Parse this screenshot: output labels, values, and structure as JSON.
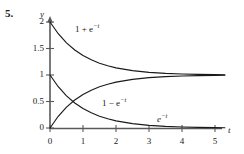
{
  "figure": {
    "problem_number": "5.",
    "axes": {
      "y_axis_name": "y",
      "x_axis_name": "t",
      "y_ticks": [
        {
          "value": 2,
          "label": "2"
        },
        {
          "value": 1.5,
          "label": "1.5"
        },
        {
          "value": 1,
          "label": "1"
        },
        {
          "value": 0.5,
          "label": "0.5"
        },
        {
          "value": 0,
          "label": "0"
        }
      ],
      "x_ticks": [
        {
          "value": 0,
          "label": "0"
        },
        {
          "value": 1,
          "label": "1"
        },
        {
          "value": 2,
          "label": "2"
        },
        {
          "value": 3,
          "label": "3"
        },
        {
          "value": 4,
          "label": "4"
        },
        {
          "value": 5,
          "label": "5"
        }
      ]
    },
    "curve_labels": {
      "upper": {
        "base": "1 + e",
        "exponent": "−t"
      },
      "middle": {
        "base": "1 − e",
        "exponent": "−t"
      },
      "lower": {
        "base": "e",
        "exponent": "−t"
      }
    },
    "colors": {
      "ink": "#1a1a1a",
      "axis": "#4a4a4a",
      "curve": "#1a1a1a",
      "background": "#ffffff"
    }
  },
  "chart_data": {
    "type": "line",
    "title": "",
    "xlabel": "t",
    "ylabel": "y",
    "xlim": [
      0,
      5.4
    ],
    "ylim": [
      0,
      2.05
    ],
    "grid": false,
    "legend": "inline-annotations",
    "xticks": [
      0,
      1,
      2,
      3,
      4,
      5
    ],
    "yticks": [
      0,
      0.5,
      1,
      1.5,
      2
    ],
    "series": [
      {
        "name": "1 + e^-t",
        "annotation": "1 + e⁻t",
        "x": [
          0,
          0.25,
          0.5,
          0.75,
          1,
          1.25,
          1.5,
          1.75,
          2,
          2.5,
          3,
          3.5,
          4,
          4.5,
          5,
          5.3
        ],
        "values": [
          2.0,
          1.779,
          1.607,
          1.472,
          1.368,
          1.287,
          1.223,
          1.174,
          1.135,
          1.082,
          1.05,
          1.03,
          1.018,
          1.011,
          1.007,
          1.005
        ]
      },
      {
        "name": "1 - e^-t",
        "annotation": "1 − e⁻t",
        "x": [
          0,
          0.25,
          0.5,
          0.75,
          1,
          1.25,
          1.5,
          1.75,
          2,
          2.5,
          3,
          3.5,
          4,
          4.5,
          5,
          5.3
        ],
        "values": [
          0.0,
          0.221,
          0.393,
          0.528,
          0.632,
          0.713,
          0.777,
          0.826,
          0.865,
          0.918,
          0.95,
          0.97,
          0.982,
          0.989,
          0.993,
          0.995
        ]
      },
      {
        "name": "e^-t",
        "annotation": "e⁻t",
        "x": [
          0,
          0.25,
          0.5,
          0.75,
          1,
          1.25,
          1.5,
          1.75,
          2,
          2.5,
          3,
          3.5,
          4,
          4.5,
          5,
          5.3
        ],
        "values": [
          1.0,
          0.779,
          0.607,
          0.472,
          0.368,
          0.287,
          0.223,
          0.174,
          0.135,
          0.082,
          0.05,
          0.03,
          0.018,
          0.011,
          0.007,
          0.005
        ]
      }
    ]
  }
}
